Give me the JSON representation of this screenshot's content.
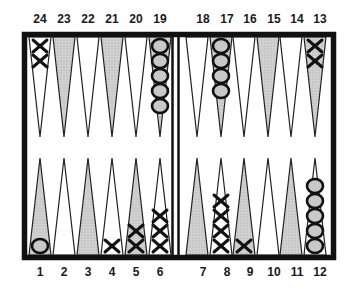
{
  "colors": {
    "frame": "#111111",
    "shaded_point": "#c8c8c8",
    "white_point": "#ffffff",
    "checker_stroke": "#111111",
    "o_fill": "#c8c8c8"
  },
  "legend": {
    "x_player": "X",
    "o_player": "O"
  },
  "top_labels": [
    "24",
    "23",
    "22",
    "21",
    "20",
    "19",
    "18",
    "17",
    "16",
    "15",
    "14",
    "13"
  ],
  "bottom_labels": [
    "1",
    "2",
    "3",
    "4",
    "5",
    "6",
    "7",
    "8",
    "9",
    "10",
    "11",
    "12"
  ],
  "points": [
    {
      "point": 1,
      "shaded": true,
      "checkers": "O",
      "count": 1
    },
    {
      "point": 2,
      "shaded": false,
      "checkers": "",
      "count": 0
    },
    {
      "point": 3,
      "shaded": true,
      "checkers": "",
      "count": 0
    },
    {
      "point": 4,
      "shaded": false,
      "checkers": "X",
      "count": 1
    },
    {
      "point": 5,
      "shaded": true,
      "checkers": "X",
      "count": 2
    },
    {
      "point": 6,
      "shaded": false,
      "checkers": "X",
      "count": 3
    },
    {
      "point": 7,
      "shaded": true,
      "checkers": "",
      "count": 0
    },
    {
      "point": 8,
      "shaded": false,
      "checkers": "X",
      "count": 4
    },
    {
      "point": 9,
      "shaded": true,
      "checkers": "X",
      "count": 1
    },
    {
      "point": 10,
      "shaded": false,
      "checkers": "",
      "count": 0
    },
    {
      "point": 11,
      "shaded": true,
      "checkers": "",
      "count": 0
    },
    {
      "point": 12,
      "shaded": false,
      "checkers": "O",
      "count": 5
    },
    {
      "point": 13,
      "shaded": true,
      "checkers": "X",
      "count": 2
    },
    {
      "point": 14,
      "shaded": false,
      "checkers": "",
      "count": 0
    },
    {
      "point": 15,
      "shaded": true,
      "checkers": "",
      "count": 0
    },
    {
      "point": 16,
      "shaded": false,
      "checkers": "",
      "count": 0
    },
    {
      "point": 17,
      "shaded": true,
      "checkers": "O",
      "count": 4
    },
    {
      "point": 18,
      "shaded": false,
      "checkers": "",
      "count": 0
    },
    {
      "point": 19,
      "shaded": true,
      "checkers": "O",
      "count": 5
    },
    {
      "point": 20,
      "shaded": false,
      "checkers": "",
      "count": 0
    },
    {
      "point": 21,
      "shaded": true,
      "checkers": "",
      "count": 0
    },
    {
      "point": 22,
      "shaded": false,
      "checkers": "",
      "count": 0
    },
    {
      "point": 23,
      "shaded": true,
      "checkers": "",
      "count": 0
    },
    {
      "point": 24,
      "shaded": false,
      "checkers": "X",
      "count": 2
    }
  ]
}
